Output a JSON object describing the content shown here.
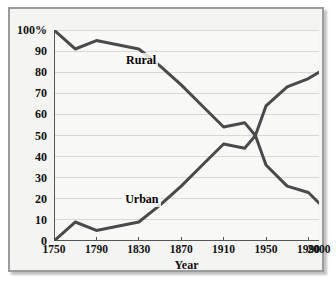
{
  "chart_data": {
    "type": "line",
    "title": "",
    "xlabel": "Year",
    "ylabel": "",
    "xlim": [
      1750,
      2000
    ],
    "ylim": [
      0,
      100
    ],
    "grid": true,
    "legend_position": "inline-labels",
    "x_ticks": [
      "1750",
      "1790",
      "1830",
      "1870",
      "1910",
      "1950",
      "1990",
      "2000"
    ],
    "x_tick_values": [
      1750,
      1790,
      1830,
      1870,
      1910,
      1950,
      1990,
      2000
    ],
    "y_ticks": [
      "0",
      "10",
      "20",
      "30",
      "40",
      "50",
      "60",
      "70",
      "80",
      "90",
      "100%"
    ],
    "y_tick_values": [
      0,
      10,
      20,
      30,
      40,
      50,
      60,
      70,
      80,
      90,
      100
    ],
    "series": [
      {
        "name": "Rural",
        "color": "#4a4a4a",
        "x": [
          1750,
          1770,
          1790,
          1810,
          1830,
          1850,
          1870,
          1890,
          1910,
          1930,
          1940,
          1950,
          1970,
          1990,
          2000
        ],
        "values": [
          100,
          91,
          95,
          93,
          91,
          83,
          74,
          64,
          54,
          56,
          50,
          36,
          26,
          23,
          18
        ]
      },
      {
        "name": "Urban",
        "color": "#4a4a4a",
        "x": [
          1750,
          1770,
          1790,
          1810,
          1830,
          1850,
          1870,
          1890,
          1910,
          1930,
          1940,
          1950,
          1970,
          1990,
          2000
        ],
        "values": [
          0,
          9,
          5,
          7,
          9,
          17,
          26,
          36,
          46,
          44,
          50,
          64,
          73,
          77,
          80
        ]
      }
    ],
    "annotations": [
      {
        "text": "Rural",
        "x": 1835,
        "y": 86
      },
      {
        "text": "Urban",
        "x": 1836,
        "y": 20
      }
    ],
    "colors": {
      "line": "#4a4a4a",
      "gridline": "#d8d8d6",
      "axis": "#555555",
      "plot_background": "#f8f8f6",
      "frame_background": "#f4f4f2",
      "frame_border": "#9b9b9b",
      "text": "#111111"
    }
  }
}
